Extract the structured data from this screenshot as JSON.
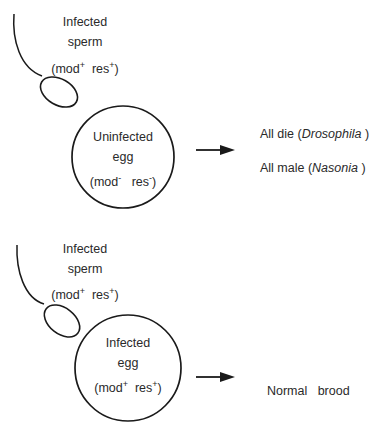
{
  "panels": [
    {
      "sperm": {
        "title": "Infected",
        "subtitle": "sperm",
        "mod": "mod",
        "mod_sign": "+",
        "res": "res",
        "res_sign": "+"
      },
      "egg": {
        "title": "Uninfected",
        "subtitle": "egg",
        "mod": "mod",
        "mod_sign": "-",
        "res": "res",
        "res_sign": "-"
      },
      "outcomes": [
        {
          "text": "All die (",
          "species": "Drosophila",
          "close": " )"
        },
        {
          "text": "All male (",
          "species": "Nasonia",
          "close": " )"
        }
      ]
    },
    {
      "sperm": {
        "title": "Infected",
        "subtitle": "sperm",
        "mod": "mod",
        "mod_sign": "+",
        "res": "res",
        "res_sign": "+"
      },
      "egg": {
        "title": "Infected",
        "subtitle": "egg",
        "mod": "mod",
        "mod_sign": "+",
        "res": "res",
        "res_sign": "+"
      },
      "outcomes": [
        {
          "text": "Normal   brood"
        }
      ]
    }
  ],
  "colors": {
    "stroke": "#1a1a1a",
    "text": "#2a2a2a",
    "background": "#ffffff"
  }
}
